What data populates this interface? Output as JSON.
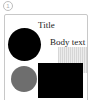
{
  "badge": {
    "label": "1"
  },
  "card": {
    "title": "Title",
    "body": "Body text",
    "shapes": [
      {
        "kind": "circle",
        "color": "#000000"
      },
      {
        "kind": "striped-rectangle",
        "color": "#e0e0e0"
      },
      {
        "kind": "circle",
        "color": "#6e6e6e"
      },
      {
        "kind": "rectangle",
        "color": "#000000"
      }
    ]
  }
}
